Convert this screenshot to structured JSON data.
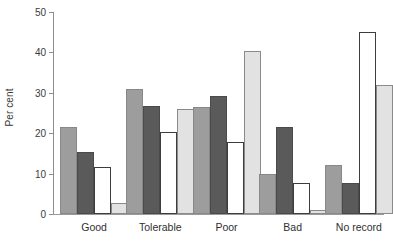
{
  "chart_data": {
    "type": "bar",
    "title": "",
    "subtitle": "",
    "xlabel": "",
    "ylabel": "Per cent",
    "ylim": [
      0,
      50
    ],
    "yticks": [
      0,
      10,
      20,
      30,
      40,
      50
    ],
    "ytick_labels": [
      "0",
      "10",
      "20",
      "30",
      "40",
      "50"
    ],
    "grid": false,
    "legend": "none",
    "categories": [
      "Good",
      "Tolerable",
      "Poor",
      "Bad",
      "No record"
    ],
    "series": [
      {
        "name": "series-1",
        "color": "#9d9d9d",
        "values": [
          21.5,
          31.0,
          26.5,
          9.8,
          12.2
        ]
      },
      {
        "name": "series-2",
        "color": "#5a5a5a",
        "values": [
          15.3,
          26.8,
          29.3,
          21.5,
          7.6
        ]
      },
      {
        "name": "series-3",
        "color": "#ffffff",
        "values": [
          11.7,
          20.3,
          17.9,
          7.7,
          45.0
        ]
      },
      {
        "name": "series-4",
        "color": "#e2e2e2",
        "values": [
          2.8,
          26.0,
          40.3,
          1.1,
          32.0
        ]
      }
    ]
  },
  "axis": {
    "y_title": "Per cent"
  }
}
